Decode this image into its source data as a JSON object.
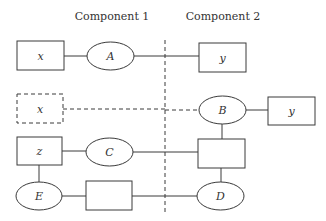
{
  "headers": {
    "component1": "Component 1",
    "component2": "Component 2"
  },
  "nodes": {
    "row1_x": "x",
    "row1_A": "A",
    "row1_y": "y",
    "row2_x": "x",
    "row2_B": "B",
    "row2_y": "y",
    "row3_z": "z",
    "row3_C": "C",
    "row3_box": "",
    "row4_E": "E",
    "row4_box": "",
    "row4_D": "D"
  },
  "colors": {
    "stroke": "#3a3a3a",
    "background": "#ffffff",
    "text": "#333333"
  }
}
